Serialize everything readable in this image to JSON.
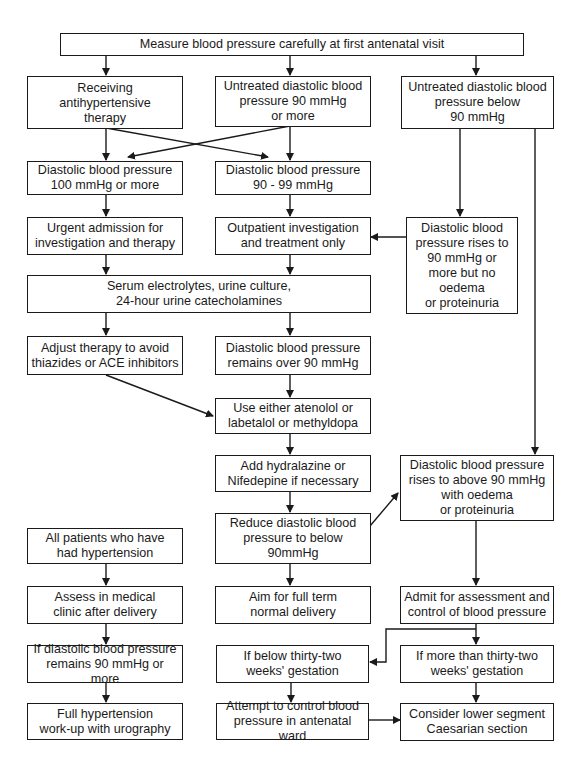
{
  "diagram": {
    "type": "flowchart",
    "line_color": "#1a1a1a",
    "nodes": {
      "start": "Measure blood pressure carefully at first antenatal visit",
      "receiving_therapy": "Receiving antihypertensive\ntherapy",
      "untreated_90_plus": "Untreated diastolic blood\npressure 90 mmHg\nor more",
      "untreated_below_90": "Untreated diastolic blood\npressure below\n90 mmHg",
      "dbp_100_plus": "Diastolic blood pressure\n100 mmHg or more",
      "dbp_90_99": "Diastolic blood pressure\n90 - 99 mmHg",
      "urgent_admission": "Urgent admission for\ninvestigation and therapy",
      "outpatient": "Outpatient investigation\nand treatment only",
      "rises_no_oedema": "Diastolic blood\npressure rises to\n90 mmHg or\nmore but no\noedema\nor proteinuria",
      "serum_tests": "Serum electrolytes, urine culture,\n24-hour urine catecholamines",
      "adjust_therapy": "Adjust therapy to avoid\nthiazides or ACE inhibitors",
      "remains_over_90": "Diastolic blood pressure\nremains over 90 mmHg",
      "use_drugs": "Use either atenolol or\nlabetalol or methyldopa",
      "add_hydralazine": "Add hydralazine or\nNifedepine if necessary",
      "rises_with_oedema": "Diastolic blood pressure\nrises to above 90 mmHg\nwith oedema\nor proteinuria",
      "reduce_dbp": "Reduce diastolic blood\npressure to below\n90mmHg",
      "all_patients": "All patients who have\nhad hypertension",
      "assess_clinic": "Assess in medical\nclinic after delivery",
      "full_term": "Aim for full term\nnormal delivery",
      "admit_assessment": "Admit for assessment and\ncontrol of blood pressure",
      "remains_90_plus": "If diastolic blood pressure\nremains 90 mmHg or more",
      "below_32_weeks": "If below thirty-two\nweeks' gestation",
      "more_32_weeks": "If more than thirty-two\nweeks' gestation",
      "full_workup": "Full hypertension\nwork-up with urography",
      "control_ward": "Attempt to control blood\npressure in antenatal ward",
      "caesarian": "Consider  lower segment\nCaesarian section"
    },
    "edges": [
      [
        "start",
        "receiving_therapy"
      ],
      [
        "start",
        "untreated_90_plus"
      ],
      [
        "start",
        "untreated_below_90"
      ],
      [
        "receiving_therapy",
        "dbp_100_plus"
      ],
      [
        "receiving_therapy",
        "dbp_90_99"
      ],
      [
        "untreated_90_plus",
        "dbp_100_plus"
      ],
      [
        "untreated_90_plus",
        "dbp_90_99"
      ],
      [
        "untreated_below_90",
        "rises_no_oedema"
      ],
      [
        "untreated_below_90",
        "rises_with_oedema"
      ],
      [
        "dbp_100_plus",
        "urgent_admission"
      ],
      [
        "dbp_90_99",
        "outpatient"
      ],
      [
        "rises_no_oedema",
        "outpatient"
      ],
      [
        "urgent_admission",
        "serum_tests"
      ],
      [
        "outpatient",
        "serum_tests"
      ],
      [
        "serum_tests",
        "adjust_therapy"
      ],
      [
        "serum_tests",
        "remains_over_90"
      ],
      [
        "adjust_therapy",
        "use_drugs"
      ],
      [
        "remains_over_90",
        "use_drugs"
      ],
      [
        "use_drugs",
        "add_hydralazine"
      ],
      [
        "add_hydralazine",
        "reduce_dbp"
      ],
      [
        "reduce_dbp",
        "rises_with_oedema"
      ],
      [
        "reduce_dbp",
        "full_term"
      ],
      [
        "rises_with_oedema",
        "admit_assessment"
      ],
      [
        "admit_assessment",
        "below_32_weeks"
      ],
      [
        "admit_assessment",
        "more_32_weeks"
      ],
      [
        "all_patients",
        "assess_clinic"
      ],
      [
        "assess_clinic",
        "remains_90_plus"
      ],
      [
        "remains_90_plus",
        "full_workup"
      ],
      [
        "below_32_weeks",
        "control_ward"
      ],
      [
        "more_32_weeks",
        "caesarian"
      ],
      [
        "control_ward",
        "caesarian"
      ]
    ]
  }
}
